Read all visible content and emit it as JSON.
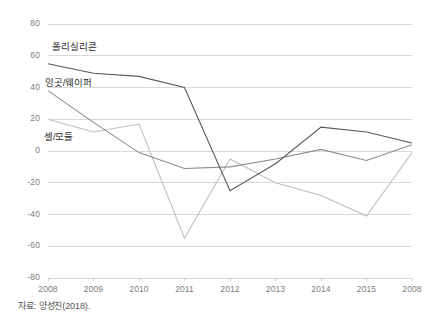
{
  "figure": {
    "source_note": "자료: 양성진(2018).",
    "background_color": "#ffffff"
  },
  "chart_data": {
    "type": "line",
    "title": "",
    "subtitle": "",
    "xlabel": "",
    "ylabel": "",
    "categories": [
      "2008",
      "2009",
      "2010",
      "2011",
      "2012",
      "2013",
      "2014",
      "2015",
      "2008"
    ],
    "x_tick_labels": [
      "2008",
      "2009",
      "2010",
      "2011",
      "2012",
      "2013",
      "2014",
      "2015",
      "2008"
    ],
    "y_tick_labels": [
      "80",
      "60",
      "40",
      "20",
      "0",
      "-20",
      "-40",
      "-60",
      "-80"
    ],
    "y_tick_values": [
      80,
      60,
      40,
      20,
      0,
      -20,
      -40,
      -60,
      -80
    ],
    "ylim": [
      -80,
      80
    ],
    "grid": true,
    "grid_axis": "y",
    "grid_color": "#d9d9d9",
    "legend": "inline-labels",
    "legend_position": "inside-upper-left",
    "series": [
      {
        "name": "폴리실리콘",
        "color": "#595959",
        "values": [
          55,
          49,
          47,
          40,
          -25,
          -8,
          15,
          12,
          5
        ]
      },
      {
        "name": "잉곳/웨이퍼",
        "color": "#8c8c8c",
        "values": [
          38,
          18,
          -1,
          -11,
          -10,
          -5,
          1,
          -6,
          4
        ]
      },
      {
        "name": "셀/모듈",
        "color": "#bfbfbf",
        "values": [
          20,
          12,
          17,
          -55,
          -5,
          -20,
          -28,
          -41,
          -1
        ]
      }
    ],
    "annotations": [
      {
        "text": "폴리실리콘",
        "series": "폴리실리콘"
      },
      {
        "text": "잉곳/웨이퍼",
        "series": "잉곳/웨이퍼"
      },
      {
        "text": "셀/모듈",
        "series": "셀/모듈"
      }
    ]
  }
}
